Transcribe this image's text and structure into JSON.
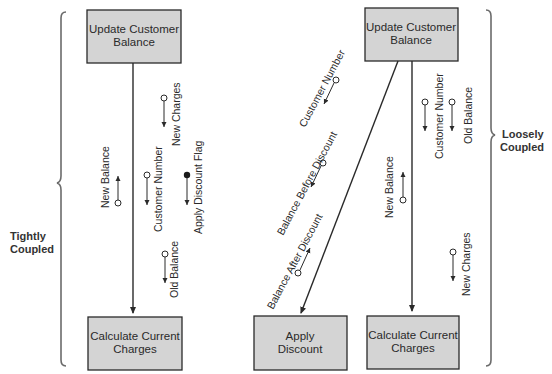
{
  "diagram": {
    "type": "structure-chart-coupling-comparison",
    "left": {
      "label_line1": "Tightly",
      "label_line2": "Coupled",
      "modules": {
        "top": {
          "line1": "Update Customer",
          "line2": "Balance"
        },
        "bottom": {
          "line1": "Calculate Current",
          "line2": "Charges"
        }
      },
      "couples": [
        {
          "name": "New Balance",
          "kind": "data",
          "direction": "up"
        },
        {
          "name": "Customer Number",
          "kind": "data",
          "direction": "down"
        },
        {
          "name": "New Charges",
          "kind": "data",
          "direction": "down"
        },
        {
          "name": "Apply Discount Flag",
          "kind": "control",
          "direction": "down"
        },
        {
          "name": "Old Balance",
          "kind": "data",
          "direction": "down"
        }
      ]
    },
    "right": {
      "label_line1": "Loosely",
      "label_line2": "Coupled",
      "modules": {
        "top": {
          "line1": "Update Customer",
          "line2": "Balance"
        },
        "bottom_left": {
          "line1": "Apply",
          "line2": "Discount"
        },
        "bottom_right": {
          "line1": "Calculate Current",
          "line2": "Charges"
        }
      },
      "couples_to_apply_discount": [
        {
          "name": "Customer Number",
          "kind": "data",
          "direction": "down"
        },
        {
          "name": "Balance Before Discount",
          "kind": "data",
          "direction": "down"
        },
        {
          "name": "Balance After Discount",
          "kind": "data",
          "direction": "up"
        }
      ],
      "couples_to_calculate_charges": [
        {
          "name": "Customer Number",
          "kind": "data",
          "direction": "down"
        },
        {
          "name": "Old Balance",
          "kind": "data",
          "direction": "down"
        },
        {
          "name": "New Balance",
          "kind": "data",
          "direction": "up"
        },
        {
          "name": "New Charges",
          "kind": "data",
          "direction": "down"
        }
      ]
    }
  }
}
